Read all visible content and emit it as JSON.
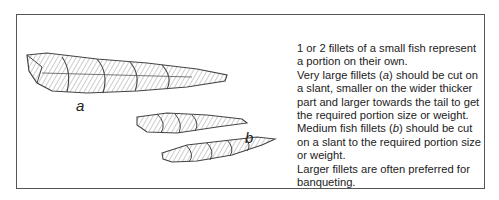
{
  "figure": {
    "labels": {
      "a": "a",
      "b": "b"
    },
    "illustrations": [
      "large-fish-fillet-a",
      "medium-fish-fillet-b-1",
      "medium-fish-fillet-b-2"
    ]
  },
  "caption": {
    "p1": "1 or 2 fillets of a small fish represent a portion on their own.",
    "p2_pre": "Very large fillets (",
    "p2_em": "a",
    "p2_post": ") should be cut on a slant, smaller on the wider thicker part and larger towards the tail to get the required portion size or weight.",
    "p3_pre": "Medium fish fillets (",
    "p3_em": "b",
    "p3_post": ") should be cut on a slant to the required portion size or weight.",
    "p4": "Larger fillets are often preferred for banqueting."
  }
}
